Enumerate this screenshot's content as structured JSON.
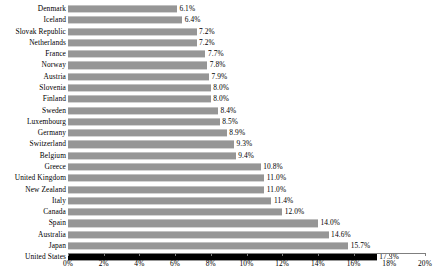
{
  "chart_data": {
    "type": "bar",
    "orientation": "horizontal",
    "title": "",
    "subtitle": "",
    "xlabel": "",
    "ylabel": "",
    "xlim": [
      0,
      20
    ],
    "grid": false,
    "legend": "none",
    "x_ticks": [
      "0%",
      "2%",
      "4%",
      "6%",
      "8%",
      "10%",
      "12%",
      "14%",
      "16%",
      "18%",
      "20%"
    ],
    "x_tick_values": [
      0,
      2,
      4,
      6,
      8,
      10,
      12,
      14,
      16,
      18,
      20
    ],
    "bar_color": "#969696",
    "highlight_color": "#000000",
    "categories": [
      "Denmark",
      "Iceland",
      "Slovak Republic",
      "Netherlands",
      "France",
      "Norway",
      "Austria",
      "Slovenia",
      "Finland",
      "Sweden",
      "Luxembourg",
      "Germany",
      "Switzerland",
      "Belgium",
      "Greece",
      "United Kingdom",
      "New Zealand",
      "Italy",
      "Canada",
      "Spain",
      "Australia",
      "Japan",
      "United States"
    ],
    "values": [
      6.1,
      6.4,
      7.2,
      7.2,
      7.7,
      7.8,
      7.9,
      8.0,
      8.0,
      8.4,
      8.5,
      8.9,
      9.3,
      9.4,
      10.8,
      11.0,
      11.0,
      11.4,
      12.0,
      14.0,
      14.6,
      15.7,
      17.3
    ],
    "value_labels": [
      "6.1%",
      "6.4%",
      "7.2%",
      "7.2%",
      "7.7%",
      "7.8%",
      "7.9%",
      "8.0%",
      "8.0%",
      "8.4%",
      "8.5%",
      "8.9%",
      "9.3%",
      "9.4%",
      "10.8%",
      "11.0%",
      "11.0%",
      "11.4%",
      "12.0%",
      "14.0%",
      "14.6%",
      "15.7%",
      "17.3%"
    ],
    "highlighted": [
      "United States"
    ]
  }
}
